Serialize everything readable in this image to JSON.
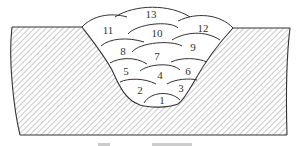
{
  "figure": {
    "bead_labels": [
      {
        "id": "1",
        "x": 162,
        "y": 101
      },
      {
        "id": "2",
        "x": 140,
        "y": 91
      },
      {
        "id": "3",
        "x": 181,
        "y": 89
      },
      {
        "id": "4",
        "x": 160,
        "y": 76
      },
      {
        "id": "5",
        "x": 126,
        "y": 72
      },
      {
        "id": "6",
        "x": 188,
        "y": 72
      },
      {
        "id": "7",
        "x": 157,
        "y": 57
      },
      {
        "id": "8",
        "x": 123,
        "y": 52
      },
      {
        "id": "9",
        "x": 193,
        "y": 48
      },
      {
        "id": "10",
        "x": 157,
        "y": 34
      },
      {
        "id": "11",
        "x": 108,
        "y": 31
      },
      {
        "id": "12",
        "x": 203,
        "y": 29
      },
      {
        "id": "13",
        "x": 151,
        "y": 15
      }
    ],
    "colors": {
      "line": "#333333",
      "hatch": "#777777",
      "background": "#ffffff"
    }
  }
}
